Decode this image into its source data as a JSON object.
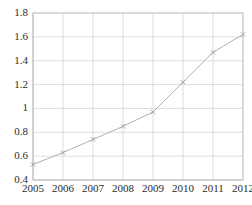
{
  "chart_data": {
    "type": "line",
    "title": "",
    "xlabel": "",
    "ylabel": "",
    "categories": [
      "2005",
      "2006",
      "2007",
      "2008",
      "2009",
      "2010",
      "2011",
      "2012"
    ],
    "values": [
      0.53,
      0.63,
      0.74,
      0.85,
      0.97,
      1.22,
      1.47,
      1.62
    ],
    "series": [
      {
        "name": "series-1",
        "values": [
          0.53,
          0.63,
          0.74,
          0.85,
          0.97,
          1.22,
          1.47,
          1.62
        ]
      }
    ],
    "ylim": [
      0.4,
      1.8
    ],
    "xlim": [
      "2005",
      "2012"
    ],
    "ytick_labels": [
      "1.8",
      "1.6",
      "1.4",
      "1.2",
      "1",
      "0.8",
      "0.6",
      "0.4"
    ],
    "ytick_values": [
      1.8,
      1.6,
      1.4,
      1.2,
      1.0,
      0.8,
      0.6,
      0.4
    ],
    "xtick_labels": [
      "2005",
      "2006",
      "2007",
      "2008",
      "2009",
      "2010",
      "2011",
      "2012"
    ],
    "grid": true,
    "legend": false,
    "legend_position": "none",
    "marker": "x",
    "line_color": "#b0b0b0",
    "marker_color": "#a0a0a0",
    "grid_color": "#cfcfcf",
    "axis_color": "#b5b5b5",
    "text_color": "#2b2b2b",
    "background_color": "#ffffff"
  }
}
